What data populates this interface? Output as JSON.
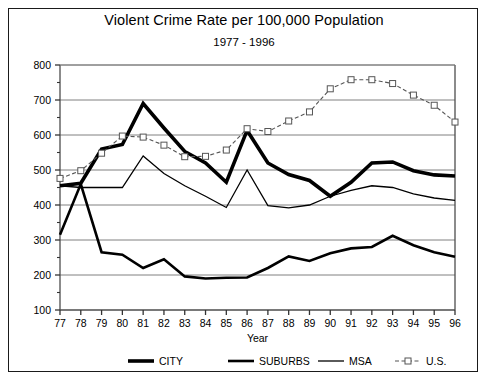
{
  "chart_data": {
    "type": "line",
    "title": "Violent Crime Rate per 100,000 Population",
    "subtitle": "1977 - 1996",
    "xlabel": "Year",
    "ylabel": "",
    "xlim": [
      77,
      96
    ],
    "ylim": [
      100,
      800
    ],
    "yticks": [
      100,
      200,
      300,
      400,
      500,
      600,
      700,
      800
    ],
    "minor_yticks": [
      150,
      250,
      350,
      450,
      550,
      650,
      750
    ],
    "grid": "horizontal",
    "legend_position": "bottom",
    "categories": [
      "77",
      "78",
      "79",
      "80",
      "81",
      "82",
      "83",
      "84",
      "85",
      "86",
      "87",
      "88",
      "89",
      "90",
      "91",
      "92",
      "93",
      "94",
      "95",
      "96"
    ],
    "series": [
      {
        "name": "CITY",
        "style": "solid",
        "width": 3.6,
        "color": "#000000",
        "marker": "none",
        "values": [
          455,
          462,
          560,
          573,
          690,
          620,
          553,
          520,
          465,
          613,
          520,
          487,
          470,
          425,
          465,
          520,
          523,
          498,
          486,
          483
        ]
      },
      {
        "name": "SUBURBS",
        "style": "solid",
        "width": 2.6,
        "color": "#000000",
        "marker": "none",
        "values": [
          315,
          460,
          265,
          258,
          220,
          245,
          196,
          190,
          192,
          193,
          220,
          253,
          240,
          262,
          276,
          280,
          312,
          285,
          265,
          252
        ]
      },
      {
        "name": "MSA",
        "style": "solid",
        "width": 1.3,
        "color": "#000000",
        "marker": "none",
        "values": [
          455,
          450,
          450,
          450,
          540,
          490,
          455,
          425,
          393,
          500,
          398,
          392,
          400,
          425,
          442,
          455,
          450,
          432,
          420,
          413
        ]
      },
      {
        "name": "U.S.",
        "style": "dashed",
        "width": 1.1,
        "color": "#555555",
        "marker": "square",
        "values": [
          476,
          498,
          548,
          597,
          594,
          571,
          538,
          539,
          557,
          618,
          610,
          640,
          666,
          732,
          758,
          758,
          747,
          714,
          685,
          637
        ]
      }
    ]
  },
  "legend": {
    "items": [
      {
        "label": "CITY"
      },
      {
        "label": "SUBURBS"
      },
      {
        "label": "MSA"
      },
      {
        "label": "U.S."
      }
    ]
  }
}
